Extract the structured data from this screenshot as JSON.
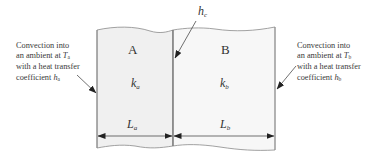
{
  "diagram": {
    "type": "two-layer composite wall heat conduction",
    "layers": [
      {
        "name": "A",
        "conductivity_symbol": "k",
        "conductivity_sub": "a",
        "length_symbol": "L",
        "length_sub": "a"
      },
      {
        "name": "B",
        "conductivity_symbol": "k",
        "conductivity_sub": "b",
        "length_symbol": "L",
        "length_sub": "b"
      }
    ],
    "contact": {
      "symbol": "h",
      "sub": "c"
    },
    "left_note": {
      "line1": "Convection into",
      "line2_pre": "an ambient at ",
      "line2_sym": "T",
      "line2_sub": "a",
      "line3": "with a heat transfer",
      "line4_pre": "coefficient ",
      "line4_sym": "h",
      "line4_sub": "a"
    },
    "right_note": {
      "line1": "Convection into",
      "line2_pre": "an ambient at ",
      "line2_sym": "T",
      "line2_sub": "b",
      "line3": "with a heat transfer",
      "line4_pre": "coefficient ",
      "line4_sym": "h",
      "line4_sub": "b"
    },
    "colors": {
      "plate_fill": "#f1f1f1",
      "plate_edge": "#8a8a8a",
      "arrow": "#222222",
      "text": "#333333"
    }
  }
}
